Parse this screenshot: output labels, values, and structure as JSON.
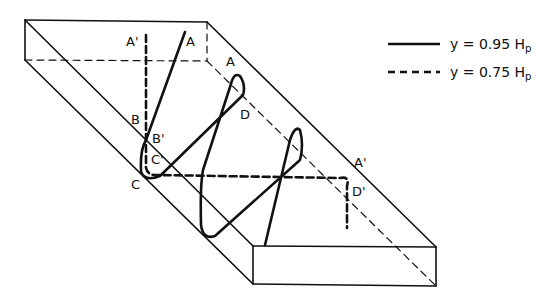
{
  "diagram": {
    "type": "isometric channel/box with surface particle paths",
    "legend": [
      {
        "style": "solid",
        "label": "y = 0.95 H",
        "subscript": "p"
      },
      {
        "style": "dashed",
        "label": "y = 0.75 H",
        "subscript": "p"
      }
    ],
    "labels": {
      "A_top_left": "A'",
      "A_top": "A",
      "A_mid": "A",
      "B": "B",
      "B_prime": "B'",
      "C": "C",
      "C_prime": "C'",
      "D": "D",
      "A_right": "A'",
      "D_prime": "D'"
    },
    "colors": {
      "line": "#111111",
      "background": "#ffffff"
    }
  }
}
